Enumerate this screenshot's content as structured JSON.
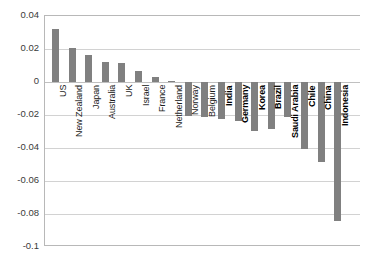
{
  "chart_data": {
    "type": "bar",
    "title": "",
    "subtitle": "",
    "xlabel": "",
    "ylabel": "",
    "ylim": [
      -0.1,
      0.04
    ],
    "grid": true,
    "legend": null,
    "orientation": "vertical",
    "bar_color": "#808080",
    "yticks": [
      "0.04",
      "0.02",
      "0",
      "-0.02",
      "-0.04",
      "-0.06",
      "-0.08",
      "-0.1"
    ],
    "ytick_values": [
      0.04,
      0.02,
      0,
      -0.02,
      -0.04,
      -0.06,
      -0.08,
      -0.1
    ],
    "categories": [
      "US",
      "New Zealand",
      "Japan",
      "Australia",
      "UK",
      "Israel",
      "France",
      "Netherland",
      "Norway",
      "Belgium",
      "India",
      "Germany",
      "Korea",
      "Brazil",
      "Saudi Arabia",
      "Chile",
      "China",
      "Indonesia"
    ],
    "values": [
      0.032,
      0.0205,
      0.0162,
      0.0122,
      0.0117,
      0.0068,
      0.0032,
      0.0009,
      -0.0205,
      -0.0215,
      -0.0225,
      -0.0235,
      -0.0295,
      -0.0285,
      -0.0215,
      -0.0405,
      -0.0485,
      -0.0843
    ],
    "label_bold": [
      false,
      false,
      false,
      false,
      false,
      false,
      false,
      false,
      false,
      false,
      true,
      true,
      true,
      true,
      true,
      true,
      true,
      true
    ]
  }
}
